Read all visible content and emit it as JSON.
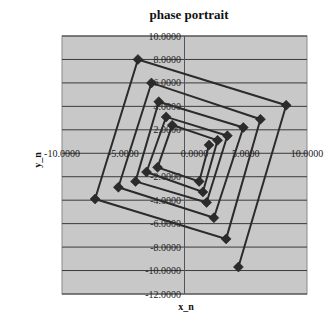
{
  "chart_data": {
    "type": "scatter",
    "title": "phase portrait",
    "xlabel": "x_n",
    "ylabel": "y_n",
    "xlim": [
      -10,
      10
    ],
    "ylim": [
      -12,
      10
    ],
    "x_ticks": [
      -10,
      -5,
      0,
      5,
      10
    ],
    "x_tick_labels": [
      "-10.0000",
      "-5.0000",
      "0.0000",
      "5.0000",
      "10.0000"
    ],
    "y_ticks": [
      10,
      8,
      6,
      4,
      2,
      -2,
      -4,
      -6,
      -8,
      -10,
      -12
    ],
    "y_tick_labels": [
      "10.0000",
      "8.0000",
      "6.0000",
      "4.0000",
      "2.0000",
      "-2.0000",
      "-4.0000",
      "-6.0000",
      "-8.0000",
      "-10.0000",
      "-12.0000"
    ],
    "grid": "horizontal",
    "legend": "none",
    "marker": "diamond",
    "lines": true,
    "series": [
      {
        "name": "phase portrait",
        "color": "#2b2b2b",
        "points": [
          [
            2.0,
            0.7
          ],
          [
            1.2,
            -2.4
          ],
          [
            -2.2,
            -1.2
          ],
          [
            -1.0,
            2.4
          ],
          [
            2.7,
            1.1
          ],
          [
            1.5,
            -3.3
          ],
          [
            -3.1,
            -1.6
          ],
          [
            -1.5,
            3.1
          ],
          [
            3.5,
            1.5
          ],
          [
            1.8,
            -4.2
          ],
          [
            -4.0,
            -2.4
          ],
          [
            -2.1,
            4.4
          ],
          [
            4.8,
            2.2
          ],
          [
            2.4,
            -5.5
          ],
          [
            -5.4,
            -2.9
          ],
          [
            -2.7,
            6.0
          ],
          [
            6.2,
            2.9
          ],
          [
            3.4,
            -7.3
          ],
          [
            -7.3,
            -3.9
          ],
          [
            -3.8,
            8.0
          ],
          [
            8.3,
            4.1
          ],
          [
            4.4,
            -9.7
          ]
        ]
      }
    ],
    "colors": {
      "plot_background": "#c8c8c8",
      "gridline": "#3a3a3a",
      "axis": "#555555"
    }
  }
}
